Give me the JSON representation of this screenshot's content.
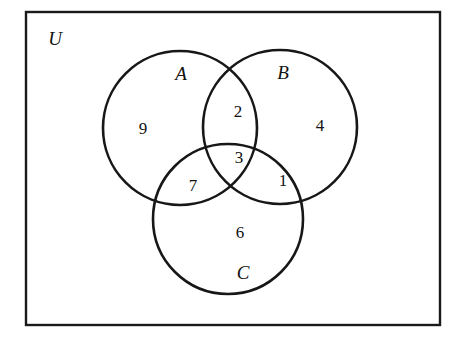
{
  "diagram": {
    "kind": "venn-diagram",
    "stroke_color": "#171717",
    "background_color": "#ffffff",
    "universe": {
      "label": "U",
      "x": 26,
      "y": 12,
      "width": 414,
      "height": 313
    },
    "sets": [
      {
        "id": "A",
        "label": "A",
        "cx": 180,
        "cy": 128,
        "r": 77,
        "label_x": 181,
        "label_y": 73
      },
      {
        "id": "B",
        "label": "B",
        "cx": 280,
        "cy": 127,
        "r": 77,
        "label_x": 283,
        "label_y": 72
      },
      {
        "id": "C",
        "label": "C",
        "cx": 228,
        "cy": 219,
        "r": 75,
        "label_x": 243,
        "label_y": 272
      }
    ],
    "universe_label_pos": {
      "x": 55,
      "y": 38
    },
    "regions": [
      {
        "id": "A-only",
        "value": "9",
        "x": 143,
        "y": 128
      },
      {
        "id": "A-and-B",
        "value": "2",
        "x": 238,
        "y": 111
      },
      {
        "id": "B-only",
        "value": "4",
        "x": 320,
        "y": 125
      },
      {
        "id": "A-B-C",
        "value": "3",
        "x": 239,
        "y": 157
      },
      {
        "id": "A-and-C",
        "value": "7",
        "x": 193,
        "y": 185
      },
      {
        "id": "B-and-C",
        "value": "1",
        "x": 283,
        "y": 180
      },
      {
        "id": "C-only",
        "value": "6",
        "x": 240,
        "y": 232
      }
    ]
  },
  "chart_data": {
    "type": "venn",
    "sets": [
      "A",
      "B",
      "C"
    ],
    "universe": "U",
    "regions": {
      "A only": 9,
      "B only": 4,
      "C only": 6,
      "A and B only": 2,
      "A and C only": 7,
      "B and C only": 1,
      "A and B and C": 3
    },
    "totals": {
      "A": 21,
      "B": 10,
      "C": 17,
      "universe_shown": 32
    },
    "annotations": [],
    "legend": "none",
    "grid": false
  }
}
